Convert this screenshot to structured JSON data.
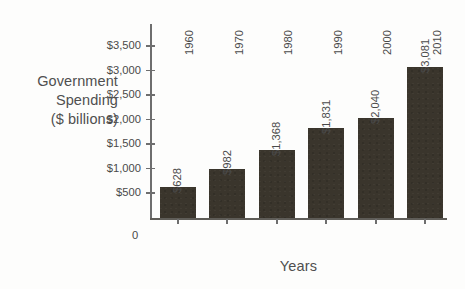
{
  "chart_data": {
    "type": "bar",
    "title": "",
    "subtitle": "",
    "xlabel": "Years",
    "ylabel": "Government Spending ($ billions)",
    "ylabel_lines": [
      "Government",
      "Spending",
      "($ billions)"
    ],
    "categories": [
      "1960",
      "1970",
      "1980",
      "1990",
      "2000",
      "2010"
    ],
    "values": [
      628,
      982,
      1368,
      1831,
      2040,
      3081
    ],
    "value_labels": [
      "$628",
      "$982",
      "$1,368",
      "$1,831",
      "$2,040",
      "$3,081"
    ],
    "ylim": [
      0,
      3500
    ],
    "ytick_values": [
      500,
      1000,
      1500,
      2000,
      2500,
      3000,
      3500
    ],
    "ytick_labels": [
      "$500",
      "$1,000",
      "$1,500",
      "$2,000",
      "$2,500",
      "$3,000",
      "$3,500"
    ],
    "origin_label": "0",
    "grid": false,
    "legend": false,
    "bar_color": "#3a352c",
    "axis_color": "#6e6e6e",
    "text_color": "#4a4a4a",
    "background_color": "#fdfdfc"
  }
}
